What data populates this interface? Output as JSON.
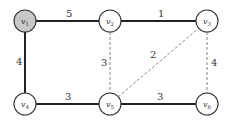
{
  "diagram": {
    "type": "weighted-graph",
    "nodes": [
      {
        "id": "v1",
        "label": "v",
        "sub": "1",
        "x": 25,
        "y": 21,
        "fill": "#c8c8c8"
      },
      {
        "id": "v2",
        "label": "v",
        "sub": "2",
        "x": 110,
        "y": 21,
        "fill": "#ffffff"
      },
      {
        "id": "v3",
        "label": "v",
        "sub": "3",
        "x": 207,
        "y": 21,
        "fill": "#ffffff"
      },
      {
        "id": "v4",
        "label": "v",
        "sub": "4",
        "x": 25,
        "y": 104,
        "fill": "#ffffff"
      },
      {
        "id": "v5",
        "label": "v",
        "sub": "5",
        "x": 110,
        "y": 104,
        "fill": "#ffffff"
      },
      {
        "id": "v6",
        "label": "v",
        "sub": "6",
        "x": 207,
        "y": 104,
        "fill": "#ffffff"
      }
    ],
    "edges": [
      {
        "from": "v1",
        "to": "v2",
        "weight": "5",
        "style": "solid"
      },
      {
        "from": "v2",
        "to": "v3",
        "weight": "1",
        "style": "solid"
      },
      {
        "from": "v1",
        "to": "v4",
        "weight": "4",
        "style": "solid"
      },
      {
        "from": "v4",
        "to": "v5",
        "weight": "3",
        "style": "solid"
      },
      {
        "from": "v5",
        "to": "v6",
        "weight": "3",
        "style": "solid"
      },
      {
        "from": "v2",
        "to": "v5",
        "weight": "3",
        "style": "dashed"
      },
      {
        "from": "v5",
        "to": "v3",
        "weight": "2",
        "style": "dashed"
      },
      {
        "from": "v3",
        "to": "v6",
        "weight": "4",
        "style": "dashed"
      }
    ],
    "labels": {
      "e_v1_v2": "5",
      "e_v2_v3": "1",
      "e_v1_v4": "4",
      "e_v4_v5": "3",
      "e_v5_v6": "3",
      "e_v2_v5": "3",
      "e_v5_v3": "2",
      "e_v3_v6": "4",
      "n1": "v",
      "n1s": "1",
      "n2": "v",
      "n2s": "2",
      "n3": "v",
      "n3s": "3",
      "n4": "v",
      "n4s": "4",
      "n5": "v",
      "n5s": "5",
      "n6": "v",
      "n6s": "6"
    },
    "colors": {
      "highlight_node": "#c8c8c8",
      "solid_edge": "#222222",
      "dashed_edge": "#888888"
    }
  }
}
